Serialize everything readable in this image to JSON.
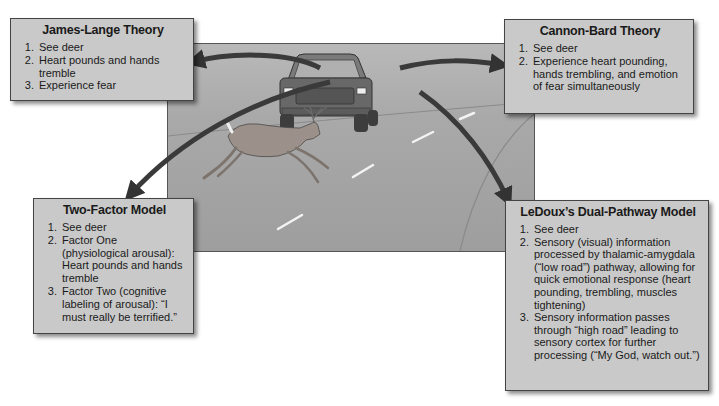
{
  "diagram": {
    "scene": {
      "description": "Road scene: pickup truck driving toward viewer while a deer leaps across the road",
      "colors": {
        "road": "#a5a5a5",
        "truck": "#6e6e6e",
        "deer": "#9a8f86",
        "lane_marks": "#f2f2f2",
        "arrow": "#3a3a3a"
      }
    },
    "theories": [
      {
        "title": "James-Lange Theory",
        "steps": [
          "See deer",
          "Heart pounds and hands tremble",
          "Experience fear"
        ]
      },
      {
        "title": "Cannon-Bard Theory",
        "steps": [
          "See deer",
          "Experience heart pounding, hands trembling, and emotion of fear simultaneously"
        ]
      },
      {
        "title": "Two-Factor Model",
        "steps": [
          "See deer",
          "Factor One (physiological arousal): Heart pounds and hands tremble",
          "Factor Two (cognitive labeling of arousal): “I must really be terrified.”"
        ]
      },
      {
        "title": "LeDoux’s Dual-Pathway Model",
        "steps": [
          "See deer",
          "Sensory (visual) information processed by thalamic-amygdala (“low road”) pathway, allowing for quick emotional response (heart pounding, trembling, muscles tightening)",
          "Sensory information passes through “high road” leading to sensory cortex for further processing (“My God, watch out.”)"
        ]
      }
    ]
  }
}
